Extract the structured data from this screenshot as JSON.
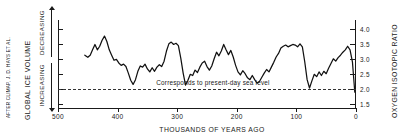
{
  "credit": "AFTER CLIMAP, J. D. HAYS ET AL.",
  "left_axis": {
    "title": "GLOBAL ICE VOLUME",
    "direction_top": "DECREASING",
    "direction_bottom": "INCREASING"
  },
  "right_axis": {
    "title": "OXYGEN ISOTOPIC RATIO"
  },
  "annotation": {
    "text": "Corresponds to present-day sea level",
    "at_value": 2.0
  },
  "chart_data": {
    "type": "line",
    "title": "",
    "xlabel": "THOUSANDS OF YEARS AGO",
    "ylabel": "OXYGEN ISOTOPIC RATIO",
    "xlim": [
      500,
      0
    ],
    "ylim": [
      4.3,
      1.35
    ],
    "xticks": [
      500,
      400,
      300,
      200,
      100,
      0
    ],
    "yticks": [
      1.5,
      2.0,
      2.5,
      3.0,
      3.5,
      4.0
    ],
    "grid": false,
    "legend": null,
    "x": [
      455,
      450,
      446,
      442,
      438,
      434,
      430,
      426,
      422,
      418,
      414,
      410,
      406,
      402,
      398,
      394,
      390,
      386,
      382,
      378,
      374,
      370,
      366,
      362,
      358,
      354,
      350,
      346,
      342,
      338,
      334,
      330,
      326,
      322,
      318,
      314,
      310,
      306,
      302,
      298,
      294,
      290,
      286,
      282,
      278,
      274,
      270,
      266,
      262,
      258,
      254,
      250,
      246,
      242,
      238,
      234,
      230,
      226,
      222,
      218,
      214,
      210,
      206,
      202,
      198,
      194,
      190,
      186,
      182,
      178,
      174,
      170,
      166,
      162,
      158,
      154,
      150,
      146,
      142,
      138,
      134,
      130,
      126,
      122,
      118,
      114,
      110,
      106,
      102,
      98,
      94,
      90,
      86,
      82,
      78,
      74,
      70,
      66,
      62,
      58,
      54,
      50,
      46,
      42,
      38,
      34,
      30,
      26,
      22,
      18,
      14,
      10,
      6,
      2
    ],
    "y": [
      3.12,
      3.05,
      3.12,
      3.3,
      3.48,
      3.3,
      3.42,
      3.62,
      3.76,
      3.58,
      3.3,
      3.12,
      2.95,
      2.98,
      2.86,
      2.78,
      2.82,
      2.74,
      2.52,
      2.28,
      2.14,
      2.3,
      2.58,
      2.76,
      2.72,
      2.82,
      2.66,
      2.56,
      2.7,
      2.58,
      2.72,
      2.8,
      2.74,
      2.92,
      3.26,
      3.5,
      3.56,
      3.48,
      3.52,
      3.44,
      3.02,
      2.52,
      2.12,
      2.28,
      2.48,
      2.44,
      2.62,
      2.54,
      2.72,
      2.86,
      2.92,
      2.74,
      2.62,
      2.76,
      3.0,
      3.22,
      3.1,
      3.26,
      3.48,
      3.3,
      3.14,
      3.28,
      3.06,
      2.78,
      2.56,
      2.46,
      2.6,
      2.5,
      2.36,
      2.3,
      2.44,
      2.3,
      2.18,
      2.24,
      2.38,
      2.52,
      2.64,
      2.56,
      2.72,
      2.88,
      3.06,
      3.18,
      3.36,
      3.42,
      3.46,
      3.4,
      3.44,
      3.48,
      3.46,
      3.4,
      3.5,
      3.4,
      2.9,
      2.3,
      2.02,
      2.26,
      2.48,
      2.4,
      2.56,
      2.44,
      2.58,
      2.5,
      2.68,
      2.84,
      3.0,
      2.92,
      3.04,
      3.12,
      3.22,
      3.3,
      3.42,
      3.3,
      2.9,
      1.88
    ]
  }
}
